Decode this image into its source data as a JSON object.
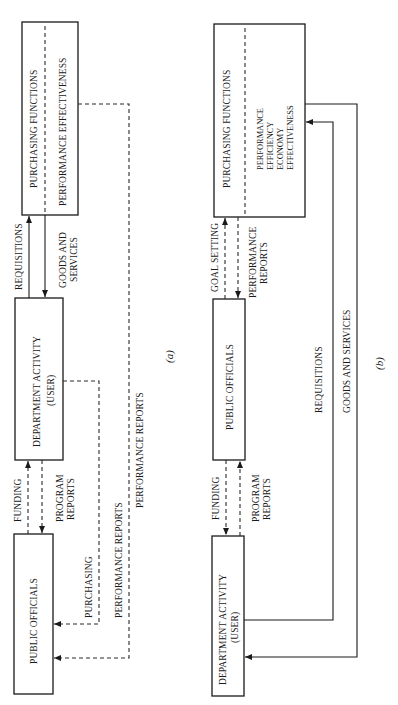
{
  "figure": {
    "orientation": "rotated-90-ccw",
    "panel_a": {
      "caption": "(a)",
      "boxes": {
        "purchasing": {
          "title": "PURCHASING FUNCTIONS",
          "sub": "PERFORMANCE EFFECTIVENESS"
        },
        "department": {
          "line1": "DEPARTMENT ACTIVITY",
          "line2": "(USER)"
        },
        "officials": {
          "title": "PUBLIC OFFICIALS"
        }
      },
      "flows": {
        "requisitions": "REQUISITIONS",
        "goods_line1": "GOODS AND",
        "goods_line2": "SERVICES",
        "funding": "FUNDING",
        "program_line1": "PROGRAM",
        "program_line2": "REPORTS",
        "purchasing": "PURCHASING",
        "perf_reports_1": "PERFORMANCE REPORTS",
        "perf_reports_2": "PERFORMANCE REPORTS"
      }
    },
    "panel_b": {
      "caption": "(b)",
      "boxes": {
        "purchasing": {
          "title": "PURCHASING FUNCTIONS",
          "sub": [
            "PERFORMANCE",
            "EFFICIENCY",
            "ECONOMY",
            "EFFECTIVENESS"
          ]
        },
        "officials": {
          "title": "PUBLIC OFFICIALS"
        },
        "department": {
          "line1": "DEPARTMENT ACTIVITY",
          "line2": "(USER)"
        }
      },
      "flows": {
        "goal_setting": "GOAL SETTING",
        "perf_line1": "PERFORMANCE",
        "perf_line2": "REPORTS",
        "funding": "FUNDING",
        "program_line1": "PROGRAM",
        "program_line2": "REPORTS",
        "requisitions": "REQUISITIONS",
        "goods": "GOODS AND SERVICES"
      }
    }
  }
}
